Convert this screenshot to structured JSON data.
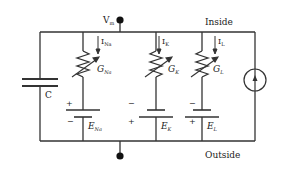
{
  "diagram": {
    "colors": {
      "wire": "#333333",
      "text": "#222222",
      "background": "#ffffff"
    },
    "labels": {
      "vm": "V",
      "vm_sub": "m",
      "inside": "Inside",
      "outside": "Outside",
      "capacitor": "C"
    },
    "branches": [
      {
        "id": "na",
        "current": "I",
        "current_sub": "Na",
        "conductance": "G",
        "conductance_sub": "Na",
        "emf": "E",
        "emf_sub": "Na",
        "top_sign": "+",
        "bottom_sign": "−"
      },
      {
        "id": "k",
        "current": "I",
        "current_sub": "K",
        "conductance": "G",
        "conductance_sub": "K",
        "emf": "E",
        "emf_sub": "K",
        "top_sign": "−",
        "bottom_sign": "+"
      },
      {
        "id": "l",
        "current": "I",
        "current_sub": "L",
        "conductance": "G",
        "conductance_sub": "L",
        "emf": "E",
        "emf_sub": "L",
        "top_sign": "−",
        "bottom_sign": "+"
      }
    ],
    "current_source": {
      "direction": "up"
    }
  }
}
